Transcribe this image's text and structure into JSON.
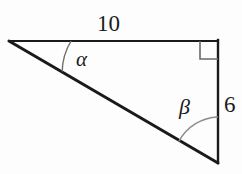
{
  "figure": {
    "type": "right-triangle-diagram",
    "background_color": "#fdfdfd",
    "stroke_color": "#1a1a1a",
    "arc_color": "#4a4a4a",
    "labels": {
      "top_side": "10",
      "right_side": "6",
      "angle_alpha": "α",
      "angle_beta": "β"
    },
    "vertices": {
      "left": {
        "x": 9,
        "y": 41
      },
      "top_right": {
        "x": 218,
        "y": 41
      },
      "bottom_right": {
        "x": 218,
        "y": 163
      }
    },
    "right_angle_marker": {
      "at_vertex": "top_right",
      "size": 18
    },
    "arcs": [
      {
        "name": "alpha-arc",
        "at_vertex": "left",
        "radius": 62
      },
      {
        "name": "beta-arc",
        "at_vertex": "bottom_right",
        "radius": 46
      }
    ]
  }
}
